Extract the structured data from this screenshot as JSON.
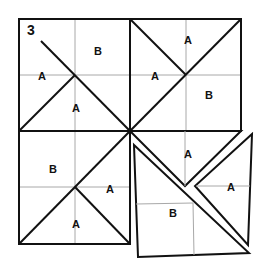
{
  "figure": {
    "number": "3",
    "labels": {
      "tl_b": "B",
      "tl_a_left": "A",
      "tl_a_bottom": "A",
      "tr_a_top": "A",
      "tr_a_left": "A",
      "tr_b": "B",
      "bl_b": "B",
      "bl_a_right": "A",
      "bl_a_bottom": "A",
      "br_a_top": "A",
      "br_a_right": "A",
      "br_b": "B"
    },
    "colors": {
      "line": "#111111",
      "grid": "#a8a8a8",
      "background": "#ffffff"
    }
  }
}
